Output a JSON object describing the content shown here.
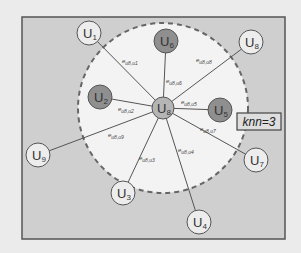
{
  "colors": {
    "page_bg": "#ebebeb",
    "frame_bg": "#cfcfcf",
    "frame_border": "#555555",
    "neighborhood_fill": "#f3f3f3",
    "dashed_border": "#666666",
    "edge": "#555555",
    "center_fill": "#b5b5b5",
    "neighbor_fill": "#8f8f8f",
    "outer_fill": "#ededed",
    "node_stroke": "#555555"
  },
  "frame": {
    "x": 22,
    "y": 17,
    "w": 263,
    "h": 222
  },
  "neighborhood": {
    "cx": 163,
    "cy": 108,
    "r": 85
  },
  "center_node": {
    "id": "u8",
    "main": "U",
    "sub": "8",
    "x": 163,
    "y": 108,
    "r": 11,
    "kind": "center"
  },
  "nodes": [
    {
      "id": "u1",
      "main": "U",
      "sub": "1",
      "x": 89,
      "y": 33,
      "r": 12,
      "kind": "outer"
    },
    {
      "id": "u6",
      "main": "U",
      "sub": "6",
      "x": 166,
      "y": 41,
      "r": 12,
      "kind": "neighbor"
    },
    {
      "id": "u8b",
      "main": "U",
      "sub": "8",
      "x": 251,
      "y": 42,
      "r": 12,
      "kind": "outer"
    },
    {
      "id": "u2",
      "main": "U",
      "sub": "2",
      "x": 100,
      "y": 97,
      "r": 12,
      "kind": "neighbor"
    },
    {
      "id": "u5",
      "main": "U",
      "sub": "5",
      "x": 220,
      "y": 110,
      "r": 12,
      "kind": "neighbor"
    },
    {
      "id": "u9",
      "main": "U",
      "sub": "9",
      "x": 38,
      "y": 155,
      "r": 12,
      "kind": "outer"
    },
    {
      "id": "u3",
      "main": "U",
      "sub": "3",
      "x": 123,
      "y": 193,
      "r": 12,
      "kind": "outer"
    },
    {
      "id": "u4",
      "main": "U",
      "sub": "4",
      "x": 199,
      "y": 222,
      "r": 12,
      "kind": "outer"
    },
    {
      "id": "u7",
      "main": "U",
      "sub": "7",
      "x": 256,
      "y": 160,
      "r": 12,
      "kind": "outer"
    }
  ],
  "edges": [
    {
      "to": "u1",
      "label": "e",
      "label_sub": "u8,u1",
      "lx": 122,
      "ly": 63
    },
    {
      "to": "u6",
      "label": "e",
      "label_sub": "u8,u6",
      "lx": 166,
      "ly": 83
    },
    {
      "to": "u8b",
      "label": "e",
      "label_sub": "u8,u8",
      "lx": 196,
      "ly": 62
    },
    {
      "to": "u2",
      "label": "e",
      "label_sub": "u8,u2",
      "lx": 118,
      "ly": 111
    },
    {
      "to": "u5",
      "label": "e",
      "label_sub": "u8,u5",
      "lx": 181,
      "ly": 104
    },
    {
      "to": "u9",
      "label": "e",
      "label_sub": "u8,u9",
      "lx": 108,
      "ly": 137
    },
    {
      "to": "u3",
      "label": "e",
      "label_sub": "u8,u3",
      "lx": 139,
      "ly": 160
    },
    {
      "to": "u4",
      "label": "e",
      "label_sub": "u8,u4",
      "lx": 178,
      "ly": 152
    },
    {
      "to": "u7",
      "label": "e",
      "label_sub": "u8,u7",
      "lx": 200,
      "ly": 131
    }
  ],
  "knn_box": {
    "text": "knn=3",
    "x": 237,
    "y": 113,
    "w": 44,
    "h": 17
  }
}
